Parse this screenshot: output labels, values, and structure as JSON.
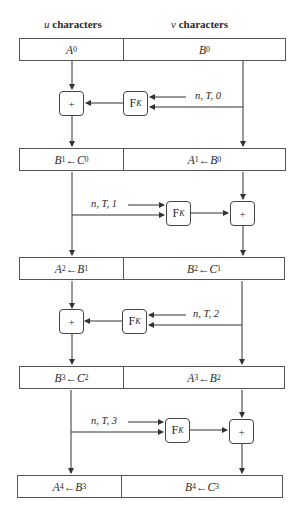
{
  "headers": {
    "u": {
      "var": "u",
      "text": " characters"
    },
    "v": {
      "var": "v",
      "text": " characters"
    }
  },
  "rounds": [
    {
      "left": {
        "main": "A",
        "sub": "0",
        "arrow": "",
        "main2": "",
        "sub2": ""
      },
      "right": {
        "main": "B",
        "sub": "0",
        "arrow": "",
        "main2": "",
        "sub2": ""
      }
    },
    {
      "left": {
        "main": "B",
        "sub": "1",
        "arrow": " ← ",
        "main2": "C",
        "sub2": "0"
      },
      "right": {
        "main": "A",
        "sub": "1",
        "arrow": " ← ",
        "main2": "B",
        "sub2": "0"
      }
    },
    {
      "left": {
        "main": "A",
        "sub": "2",
        "arrow": " ← ",
        "main2": "B",
        "sub2": "1"
      },
      "right": {
        "main": "B",
        "sub": "2",
        "arrow": " ← ",
        "main2": "C",
        "sub2": "1"
      }
    },
    {
      "left": {
        "main": "B",
        "sub": "3",
        "arrow": " ← ",
        "main2": "C",
        "sub2": "2"
      },
      "right": {
        "main": "A",
        "sub": "3",
        "arrow": " ← ",
        "main2": "B",
        "sub2": "2"
      }
    },
    {
      "left": {
        "main": "A",
        "sub": "4",
        "arrow": " ← ",
        "main2": "B",
        "sub2": "3"
      },
      "right": {
        "main": "B",
        "sub": "4",
        "arrow": " ← ",
        "main2": "C",
        "sub2": "3"
      }
    }
  ],
  "operators": {
    "plus": "+",
    "f_main": "F",
    "f_sub": "K"
  },
  "tweaks": [
    {
      "label": "n, T, 0"
    },
    {
      "label": "n, T, 1"
    },
    {
      "label": "n, T, 2"
    },
    {
      "label": "n, T, 3"
    }
  ],
  "colors": {
    "line": "#333333",
    "box_border": "#555555"
  }
}
